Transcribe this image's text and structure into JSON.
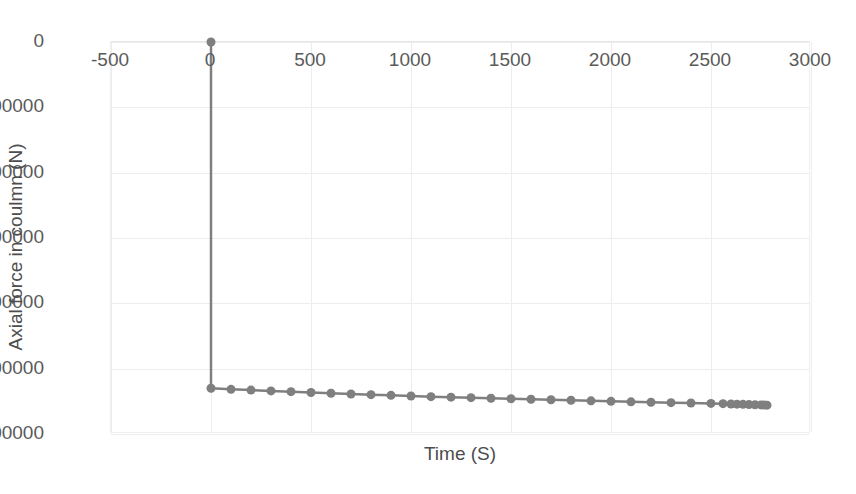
{
  "chart_data": {
    "type": "line",
    "title": "",
    "xlabel": "Time (S)",
    "ylabel": "Axial force in coulmn (N)",
    "xlim": [
      -500,
      3000
    ],
    "ylim": [
      -3000000,
      0
    ],
    "xticks": [
      -500,
      0,
      500,
      1000,
      1500,
      2000,
      2500,
      3000
    ],
    "xtick_labels": [
      "-500",
      "0",
      "500",
      "1000",
      "1500",
      "2000",
      "2500",
      "3000"
    ],
    "yticks": [
      0,
      -500000,
      -1000000,
      -1500000,
      -2000000,
      -2500000,
      -3000000
    ],
    "ytick_labels": [
      "0",
      "-500000",
      "-1000000",
      "-1500000",
      "-2000000",
      "-2500000",
      "-3000000"
    ],
    "grid": true,
    "legend": false,
    "marker": "circle",
    "marker_size": 9,
    "line_color": "#7f7f7f",
    "marker_color": "#7f7f7f",
    "line_width": 2.5,
    "gridline_color": "#ededed",
    "axis_text_color": "#5a5a5a",
    "series": [
      {
        "name": "Axial force in coulmn (N)",
        "x": [
          0,
          0,
          100,
          200,
          300,
          400,
          500,
          600,
          700,
          800,
          900,
          1000,
          1100,
          1200,
          1300,
          1400,
          1500,
          1600,
          1700,
          1800,
          1900,
          2000,
          2100,
          2200,
          2300,
          2400,
          2500,
          2560,
          2600,
          2630,
          2660,
          2690,
          2720,
          2750,
          2765,
          2780
        ],
        "y": [
          0,
          -2650000,
          -2658000,
          -2664000,
          -2670000,
          -2676000,
          -2682000,
          -2688000,
          -2694000,
          -2699000,
          -2704000,
          -2709000,
          -2714000,
          -2718000,
          -2722000,
          -2726000,
          -2730000,
          -2734000,
          -2738000,
          -2742000,
          -2746000,
          -2750000,
          -2754000,
          -2757000,
          -2760000,
          -2763000,
          -2766000,
          -2768000,
          -2770000,
          -2771500,
          -2773000,
          -2774500,
          -2776000,
          -2777500,
          -2778500,
          -2779500
        ]
      }
    ]
  }
}
